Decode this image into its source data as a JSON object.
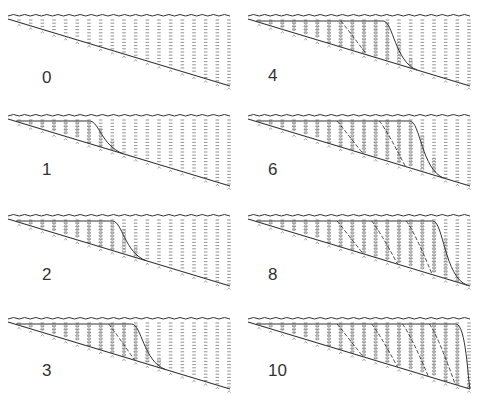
{
  "figure": {
    "colors": {
      "ink": "#333333",
      "hatch": "#777777",
      "fill_marker": "#888888",
      "background": "#ffffff"
    },
    "panels": [
      {
        "label": "0",
        "stage": 0,
        "left": 0,
        "top": 0,
        "label_x": 42,
        "label_y": 68,
        "deposit_end": 0,
        "foreset_lines": []
      },
      {
        "label": "1",
        "stage": 1,
        "left": 0,
        "top": 100,
        "label_x": 42,
        "label_y": 60,
        "deposit_end": 0.34,
        "foreset_lines": []
      },
      {
        "label": "2",
        "stage": 2,
        "left": 0,
        "top": 200,
        "label_x": 42,
        "label_y": 65,
        "deposit_end": 0.46,
        "foreset_lines": []
      },
      {
        "label": "3",
        "stage": 3,
        "left": 0,
        "top": 303,
        "label_x": 42,
        "label_y": 58,
        "deposit_end": 0.56,
        "foreset_lines": [
          0.42
        ]
      },
      {
        "label": "4",
        "stage": 4,
        "left": 240,
        "top": 0,
        "label_x": 28,
        "label_y": 66,
        "deposit_end": 0.62,
        "foreset_lines": [
          0.38
        ]
      },
      {
        "label": "6",
        "stage": 6,
        "left": 240,
        "top": 100,
        "label_x": 28,
        "label_y": 60,
        "deposit_end": 0.76,
        "foreset_lines": [
          0.36,
          0.58
        ]
      },
      {
        "label": "8",
        "stage": 8,
        "left": 240,
        "top": 200,
        "label_x": 28,
        "label_y": 65,
        "deposit_end": 0.88,
        "foreset_lines": [
          0.36,
          0.54,
          0.72
        ]
      },
      {
        "label": "10",
        "stage": 10,
        "left": 240,
        "top": 303,
        "label_x": 28,
        "label_y": 58,
        "deposit_end": 1.0,
        "foreset_lines": [
          0.36,
          0.54,
          0.7,
          0.84
        ]
      }
    ]
  }
}
